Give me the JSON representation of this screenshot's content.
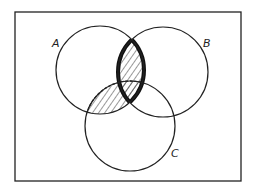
{
  "diagram": {
    "type": "venn",
    "universe": {
      "x": 15,
      "y": 12,
      "width": 226,
      "height": 169
    },
    "sets": [
      {
        "label": "A",
        "cx": 100,
        "cy": 70,
        "r": 44,
        "label_x": 52,
        "label_y": 47
      },
      {
        "label": "B",
        "cx": 163,
        "cy": 72,
        "r": 45,
        "label_x": 203,
        "label_y": 47
      },
      {
        "label": "C",
        "cx": 130,
        "cy": 126,
        "r": 45,
        "label_x": 171,
        "label_y": 157
      }
    ],
    "shaded_regions": [
      {
        "name": "A ∩ B",
        "style": "hatched, bold outline"
      },
      {
        "name": "A ∩ C",
        "style": "hatched"
      }
    ],
    "colors": {
      "stroke": "#222222",
      "background": "#ffffff"
    }
  }
}
